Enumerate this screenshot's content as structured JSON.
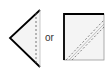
{
  "diagram": {
    "shapes": [
      {
        "name": "folded-triangle",
        "fill": "#f4f4f4",
        "stroke": "#000000",
        "fold_line": "dashed-vertical"
      },
      {
        "name": "folded-square",
        "fill": "#f4f4f4",
        "stroke": "#000000",
        "fold_line": "dashed-diagonal"
      }
    ],
    "connector_text": "or"
  }
}
